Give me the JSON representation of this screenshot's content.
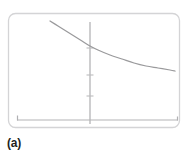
{
  "figure": {
    "caption": "(a)",
    "panel_label": "(a)",
    "background_color": "#ffffff",
    "frame_color": "#d4d4d6",
    "axis_color": "#b4b4b6",
    "curve_color": "#9a9a9c",
    "caption_color": "#231f20"
  },
  "chart_data": {
    "type": "line",
    "title": "",
    "subtitle": "",
    "xlabel": "",
    "ylabel": "",
    "grid": false,
    "legend_position": "none",
    "annotations": [
      {
        "name": "panel-label",
        "text": "(a)",
        "position": "below-left"
      }
    ],
    "axes": {
      "x_axis": {
        "visible": true,
        "orientation": "horizontal",
        "tick_labels": [],
        "end_ticks": true,
        "pixel_y": 120,
        "pixel_x_start": 17,
        "pixel_x_end": 178
      },
      "y_axis": {
        "visible": true,
        "orientation": "vertical",
        "tick_labels": [],
        "tick_count": 3,
        "pixel_x": 90,
        "pixel_y_start": 22,
        "pixel_y_end": 124,
        "tick_pixel_y": [
          48,
          75,
          96
        ]
      },
      "xlim": [
        0,
        1
      ],
      "ylim": [
        0,
        1
      ]
    },
    "series": [
      {
        "name": "decaying-curve",
        "shape": "monotonic decreasing convex",
        "color": "#9a9a9c",
        "x": [
          50,
          58,
          66,
          74,
          82,
          90,
          98,
          110,
          122,
          134,
          146,
          158,
          170,
          175
        ],
        "y": [
          21,
          26,
          31,
          36,
          41,
          46,
          50,
          55,
          59,
          63,
          66,
          68,
          70,
          71
        ],
        "x_data": [
          0.2,
          0.26,
          0.32,
          0.38,
          0.44,
          0.5,
          0.55,
          0.63,
          0.71,
          0.78,
          0.85,
          0.92,
          0.99,
          1.02
        ],
        "y_data": [
          1.0,
          0.9,
          0.8,
          0.7,
          0.61,
          0.52,
          0.45,
          0.36,
          0.29,
          0.23,
          0.18,
          0.15,
          0.13,
          0.12
        ]
      }
    ]
  }
}
